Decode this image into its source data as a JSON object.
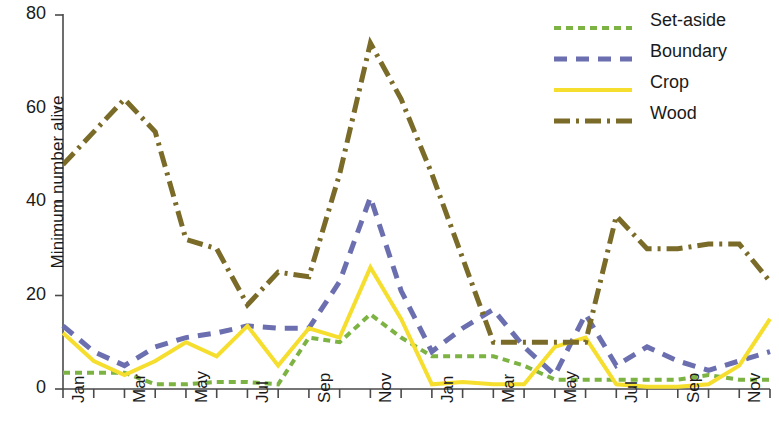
{
  "chart_data": {
    "type": "line",
    "title": "",
    "xlabel": "",
    "ylabel": "Minimum number alive",
    "ylim": [
      0,
      80
    ],
    "yticks": [
      0,
      20,
      40,
      60,
      80
    ],
    "ytick_labels": [
      "0",
      "20",
      "40",
      "60",
      "80"
    ],
    "grid": false,
    "legend_position": "top-right",
    "x": [
      "Jan",
      "Feb",
      "Mar",
      "Apr",
      "May",
      "Jun",
      "Jul",
      "Aug",
      "Sep",
      "Oct",
      "Nov",
      "Dec",
      "Jan",
      "Feb",
      "Mar",
      "Apr",
      "May",
      "Jun",
      "Jul",
      "Aug",
      "Sep",
      "Oct",
      "Nov",
      "Dec"
    ],
    "xtick_labels": [
      "Jan",
      "",
      "Mar",
      "",
      "May",
      "",
      "Jul",
      "",
      "Sep",
      "",
      "Nov",
      "",
      "Jan",
      "",
      "Mar",
      "",
      "May",
      "",
      "Jul",
      "",
      "Sep",
      "",
      "Nov",
      ""
    ],
    "categories": [
      "Jan",
      "Feb",
      "Mar",
      "Apr",
      "May",
      "Jun",
      "Jul",
      "Aug",
      "Sep",
      "Oct",
      "Nov",
      "Dec",
      "Jan",
      "Feb",
      "Mar",
      "Apr",
      "May",
      "Jun",
      "Jul",
      "Aug",
      "Sep",
      "Oct",
      "Nov",
      "Dec"
    ],
    "series": [
      {
        "name": "Set-aside",
        "color": "#7CB342",
        "dash": "7,5",
        "width": 4,
        "values": [
          3.5,
          3.5,
          3.5,
          1,
          1,
          1.5,
          1.5,
          1,
          11,
          10,
          16,
          11,
          7,
          7,
          7,
          5,
          2,
          2,
          2,
          2,
          2,
          3,
          2,
          2
        ]
      },
      {
        "name": "Boundary",
        "color": "#6B6FAF",
        "dash": "13,9",
        "width": 5,
        "values": [
          13.5,
          8,
          5,
          9,
          11,
          12,
          13.5,
          13,
          13,
          23,
          41,
          21,
          8,
          13,
          17,
          9,
          3,
          16,
          5,
          9,
          6,
          4,
          6,
          8
        ]
      },
      {
        "name": "Crop",
        "color": "#F5DE2E",
        "dash": "none",
        "width": 4,
        "values": [
          12,
          6,
          3,
          6,
          10,
          7,
          13.5,
          5,
          13,
          11,
          26,
          15,
          1,
          1.5,
          1,
          1,
          9,
          11,
          1,
          0.5,
          0.5,
          1,
          5,
          15
        ]
      },
      {
        "name": "Wood",
        "color": "#7A6B28",
        "dash": "16,6,3,6",
        "width": 5,
        "values": [
          48,
          55,
          62,
          55,
          32,
          30,
          18,
          25,
          24,
          46,
          74,
          62,
          46,
          28,
          10,
          10,
          10,
          10,
          37,
          30,
          30,
          31,
          31,
          23
        ]
      }
    ]
  },
  "legend": {
    "items": [
      {
        "label": "Set-aside"
      },
      {
        "label": "Boundary"
      },
      {
        "label": "Crop"
      },
      {
        "label": "Wood"
      }
    ]
  },
  "axes": {
    "y_title": "Minimum number alive"
  }
}
